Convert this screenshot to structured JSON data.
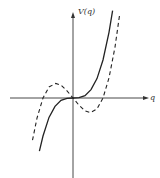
{
  "chart_data": {
    "type": "line",
    "title": "",
    "xlabel": "q",
    "ylabel": "V(q)",
    "grid": false,
    "legend": null,
    "axes": {
      "x_ticks": [],
      "y_ticks": [],
      "origin_centered": true
    },
    "xlim": [
      -1.6,
      1.9
    ],
    "ylim": [
      -2.0,
      1.9
    ],
    "series": [
      {
        "name": "solid",
        "style": "solid",
        "color": "#222222",
        "formula": "V = q^3",
        "x": [
          -1.12,
          -1.0,
          -0.8,
          -0.6,
          -0.4,
          -0.2,
          0.0,
          0.2,
          0.4,
          0.6,
          0.8,
          1.0,
          1.2,
          1.32
        ],
        "y": [
          -1.4,
          -1.0,
          -0.51,
          -0.22,
          -0.06,
          -0.01,
          0.0,
          0.01,
          0.06,
          0.22,
          0.51,
          1.0,
          1.73,
          2.3
        ]
      },
      {
        "name": "dashed",
        "style": "dashed",
        "color": "#222222",
        "formula": "V = q^3 - q",
        "x": [
          -1.35,
          -1.2,
          -1.0,
          -0.8,
          -0.577,
          -0.4,
          -0.2,
          0.0,
          0.2,
          0.4,
          0.577,
          0.8,
          1.0,
          1.2,
          1.4,
          1.55
        ],
        "y": [
          -1.11,
          -0.53,
          0.0,
          0.29,
          0.385,
          0.34,
          0.19,
          0.0,
          -0.19,
          -0.34,
          -0.385,
          -0.29,
          0.0,
          0.53,
          1.34,
          2.17
        ]
      }
    ]
  },
  "labels": {
    "y_axis": "V(q)",
    "x_axis": "q"
  }
}
